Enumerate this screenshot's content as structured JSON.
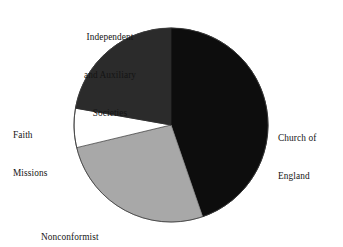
{
  "figure": {
    "background_color": "#ffffff",
    "center_x": 171,
    "center_y": 125,
    "radius": 97
  },
  "labels": {
    "independent": {
      "line1": "Independent",
      "line2": "and Auxiliary",
      "line3": "Societies"
    },
    "faith": {
      "line1": "Faith",
      "line2": "Missions"
    },
    "church": {
      "line1": "Church of",
      "line2": "England"
    },
    "nonconformist": {
      "line1": "Nonconformist"
    }
  },
  "chart_data": {
    "type": "pie",
    "title": "",
    "subtitle": "",
    "xlabel": "",
    "ylabel": "",
    "grid": false,
    "legend_position": "outside-labels",
    "start_angle_deg": 0,
    "direction": "clockwise",
    "categories": [
      "Church of England",
      "Nonconformist",
      "Faith Missions",
      "Independent and Auxiliary Societies"
    ],
    "values": [
      44.7,
      26.5,
      6.5,
      22.3
    ],
    "units": "percent",
    "slices": [
      {
        "label": "Church of England",
        "value": 44.7,
        "start_angle_deg": 0,
        "end_angle_deg": 161,
        "color": "#0d0d0d",
        "stroke": "#0d0d0d",
        "label_position": "right"
      },
      {
        "label": "Nonconformist",
        "value": 26.5,
        "start_angle_deg": 161,
        "end_angle_deg": 256.5,
        "color": "#a8a8a8",
        "stroke": "#8d8d8d",
        "label_position": "bottom-left"
      },
      {
        "label": "Faith Missions",
        "value": 6.5,
        "start_angle_deg": 256.5,
        "end_angle_deg": 280,
        "color": "#ffffff",
        "stroke": "#4a4a4a",
        "label_position": "left"
      },
      {
        "label": "Independent and Auxiliary Societies",
        "value": 22.3,
        "start_angle_deg": 280,
        "end_angle_deg": 360,
        "color": "#2b2b2b",
        "stroke": "#2b2b2b",
        "label_position": "top-left"
      }
    ]
  }
}
